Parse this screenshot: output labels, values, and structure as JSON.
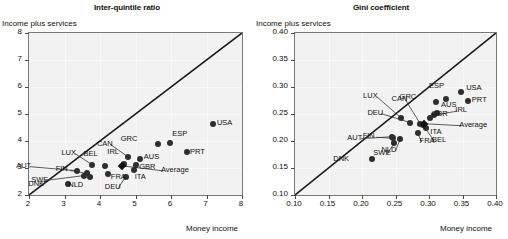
{
  "figure": {
    "panels": [
      {
        "key": "left",
        "title": "Inter-quintile ratio",
        "ylabel": "Income plus services",
        "xlabel": "Money income"
      },
      {
        "key": "right",
        "title": "Gini coefficient",
        "ylabel": "Income plus services",
        "xlabel": "Money income"
      }
    ]
  },
  "chart_data": [
    {
      "type": "scatter",
      "title": "Inter-quintile ratio",
      "xlabel": "Money income",
      "ylabel": "Income plus services",
      "xlim": [
        2,
        8
      ],
      "ylim": [
        2,
        8
      ],
      "xticks": [
        "2",
        "3",
        "4",
        "5",
        "6",
        "7",
        "8"
      ],
      "yticks": [
        "2",
        "3",
        "4",
        "5",
        "6",
        "7",
        "8"
      ],
      "grid": true,
      "legend": "none",
      "reference_line": {
        "type": "identity",
        "from": [
          2,
          2
        ],
        "to": [
          8,
          8
        ]
      },
      "points": [
        {
          "label": "AUT",
          "x": 3.35,
          "y": 2.9,
          "label_dx": -46,
          "label_dy": -4,
          "leader": true
        },
        {
          "label": "SWE",
          "x": 3.55,
          "y": 2.72,
          "label_dx": -38,
          "label_dy": 5,
          "leader": true
        },
        {
          "label": "DNK",
          "x": 3.1,
          "y": 2.42,
          "label_dx": -25,
          "label_dy": 1,
          "leader": false
        },
        {
          "label": "FIN",
          "x": 3.62,
          "y": 2.8,
          "label_dx": -16,
          "label_dy": -3,
          "leader": true
        },
        {
          "label": "LUX",
          "x": 3.78,
          "y": 3.12,
          "label_dx": -16,
          "label_dy": -11,
          "leader": true
        },
        {
          "label": "NLD",
          "x": 3.72,
          "y": 2.66,
          "label_dx": -7,
          "label_dy": 9,
          "leader": false
        },
        {
          "label": "BEL",
          "x": 4.15,
          "y": 3.07,
          "label_dx": -7,
          "label_dy": -11,
          "leader": false
        },
        {
          "label": "FRA",
          "x": 4.22,
          "y": 2.76,
          "label_dx": 4,
          "label_dy": 4,
          "leader": false
        },
        {
          "label": "DEU",
          "x": 4.72,
          "y": 2.68,
          "label_dx": -6,
          "label_dy": 11,
          "leader": true
        },
        {
          "label": "IRL",
          "x": 4.68,
          "y": 3.15,
          "label_dx": -2,
          "label_dy": -11,
          "leader": false
        },
        {
          "label": "CAN",
          "x": 4.78,
          "y": 3.42,
          "label_dx": -16,
          "label_dy": -12,
          "leader": true
        },
        {
          "label": "ITA",
          "x": 4.95,
          "y": 2.92,
          "label_dx": 2,
          "label_dy": 8,
          "leader": false
        },
        {
          "label": "GBR",
          "x": 5.02,
          "y": 3.12,
          "label_dx": 4,
          "label_dy": 3,
          "leader": false
        },
        {
          "label": "Average",
          "x": 4.62,
          "y": 3.08,
          "label_dx": 40,
          "label_dy": 5,
          "leader": true
        },
        {
          "label": "AUS",
          "x": 5.12,
          "y": 3.32,
          "label_dx": 5,
          "label_dy": -1,
          "leader": false
        },
        {
          "label": "GRC",
          "x": 5.62,
          "y": 3.88,
          "label_dx": -22,
          "label_dy": -4,
          "leader": false
        },
        {
          "label": "ESP",
          "x": 5.98,
          "y": 3.92,
          "label_dx": 3,
          "label_dy": -8,
          "leader": false
        },
        {
          "label": "PRT",
          "x": 6.45,
          "y": 3.6,
          "label_dx": 4,
          "label_dy": 1,
          "leader": false
        },
        {
          "label": "USA",
          "x": 7.18,
          "y": 4.62,
          "label_dx": 5,
          "label_dy": 0,
          "leader": false
        }
      ]
    },
    {
      "type": "scatter",
      "title": "Gini coefficient",
      "xlabel": "Money income",
      "ylabel": "Income plus services",
      "xlim": [
        0.1,
        0.4
      ],
      "ylim": [
        0.1,
        0.4
      ],
      "xticks": [
        "0.10",
        "0.15",
        "0.20",
        "0.25",
        "0.30",
        "0.35",
        "0.40"
      ],
      "yticks": [
        "0.10",
        "0.15",
        "0.20",
        "0.25",
        "0.30",
        "0.35",
        "0.40"
      ],
      "grid": true,
      "legend": "none",
      "reference_line": {
        "type": "identity",
        "from": [
          0.1,
          0.1
        ],
        "to": [
          0.4,
          0.4
        ]
      },
      "points": [
        {
          "label": "DNK",
          "x": 0.215,
          "y": 0.167,
          "label_dx": -24,
          "label_dy": 1,
          "leader": false
        },
        {
          "label": "AUT",
          "x": 0.245,
          "y": 0.208,
          "label_dx": -30,
          "label_dy": 2,
          "leader": true
        },
        {
          "label": "FIN",
          "x": 0.247,
          "y": 0.205,
          "label_dx": -16,
          "label_dy": -1,
          "leader": true
        },
        {
          "label": "SWE",
          "x": 0.248,
          "y": 0.196,
          "label_dx": -6,
          "label_dy": 11,
          "leader": true
        },
        {
          "label": "NLD",
          "x": 0.257,
          "y": 0.203,
          "label_dx": -4,
          "label_dy": 12,
          "leader": true
        },
        {
          "label": "LUX",
          "x": 0.258,
          "y": 0.243,
          "label_dx": -23,
          "label_dy": -21,
          "leader": true
        },
        {
          "label": "DEU",
          "x": 0.272,
          "y": 0.234,
          "label_dx": -28,
          "label_dy": -9,
          "leader": true
        },
        {
          "label": "FRA",
          "x": 0.283,
          "y": 0.215,
          "label_dx": 3,
          "label_dy": 9,
          "leader": true
        },
        {
          "label": "CAN",
          "x": 0.287,
          "y": 0.232,
          "label_dx": -14,
          "label_dy": -24,
          "leader": true
        },
        {
          "label": "BEL",
          "x": 0.291,
          "y": 0.23,
          "label_dx": 10,
          "label_dy": 16,
          "leader": true
        },
        {
          "label": "ITA",
          "x": 0.296,
          "y": 0.224,
          "label_dx": 5,
          "label_dy": 5,
          "leader": false
        },
        {
          "label": "Average",
          "x": 0.293,
          "y": 0.232,
          "label_dx": 36,
          "label_dy": 2,
          "leader": true
        },
        {
          "label": "GBR",
          "x": 0.302,
          "y": 0.243,
          "label_dx": 2,
          "label_dy": -3,
          "leader": false
        },
        {
          "label": "IRL",
          "x": 0.308,
          "y": 0.248,
          "label_dx": 22,
          "label_dy": -4,
          "leader": true
        },
        {
          "label": "AUS",
          "x": 0.312,
          "y": 0.252,
          "label_dx": 5,
          "label_dy": -7,
          "leader": false
        },
        {
          "label": "GRC",
          "x": 0.311,
          "y": 0.272,
          "label_dx": -22,
          "label_dy": -4,
          "leader": false
        },
        {
          "label": "ESP",
          "x": 0.325,
          "y": 0.278,
          "label_dx": -2,
          "label_dy": -12,
          "leader": false
        },
        {
          "label": "PRT",
          "x": 0.358,
          "y": 0.275,
          "label_dx": 5,
          "label_dy": 0,
          "leader": false
        },
        {
          "label": "USA",
          "x": 0.348,
          "y": 0.291,
          "label_dx": 6,
          "label_dy": -3,
          "leader": false
        }
      ]
    }
  ]
}
